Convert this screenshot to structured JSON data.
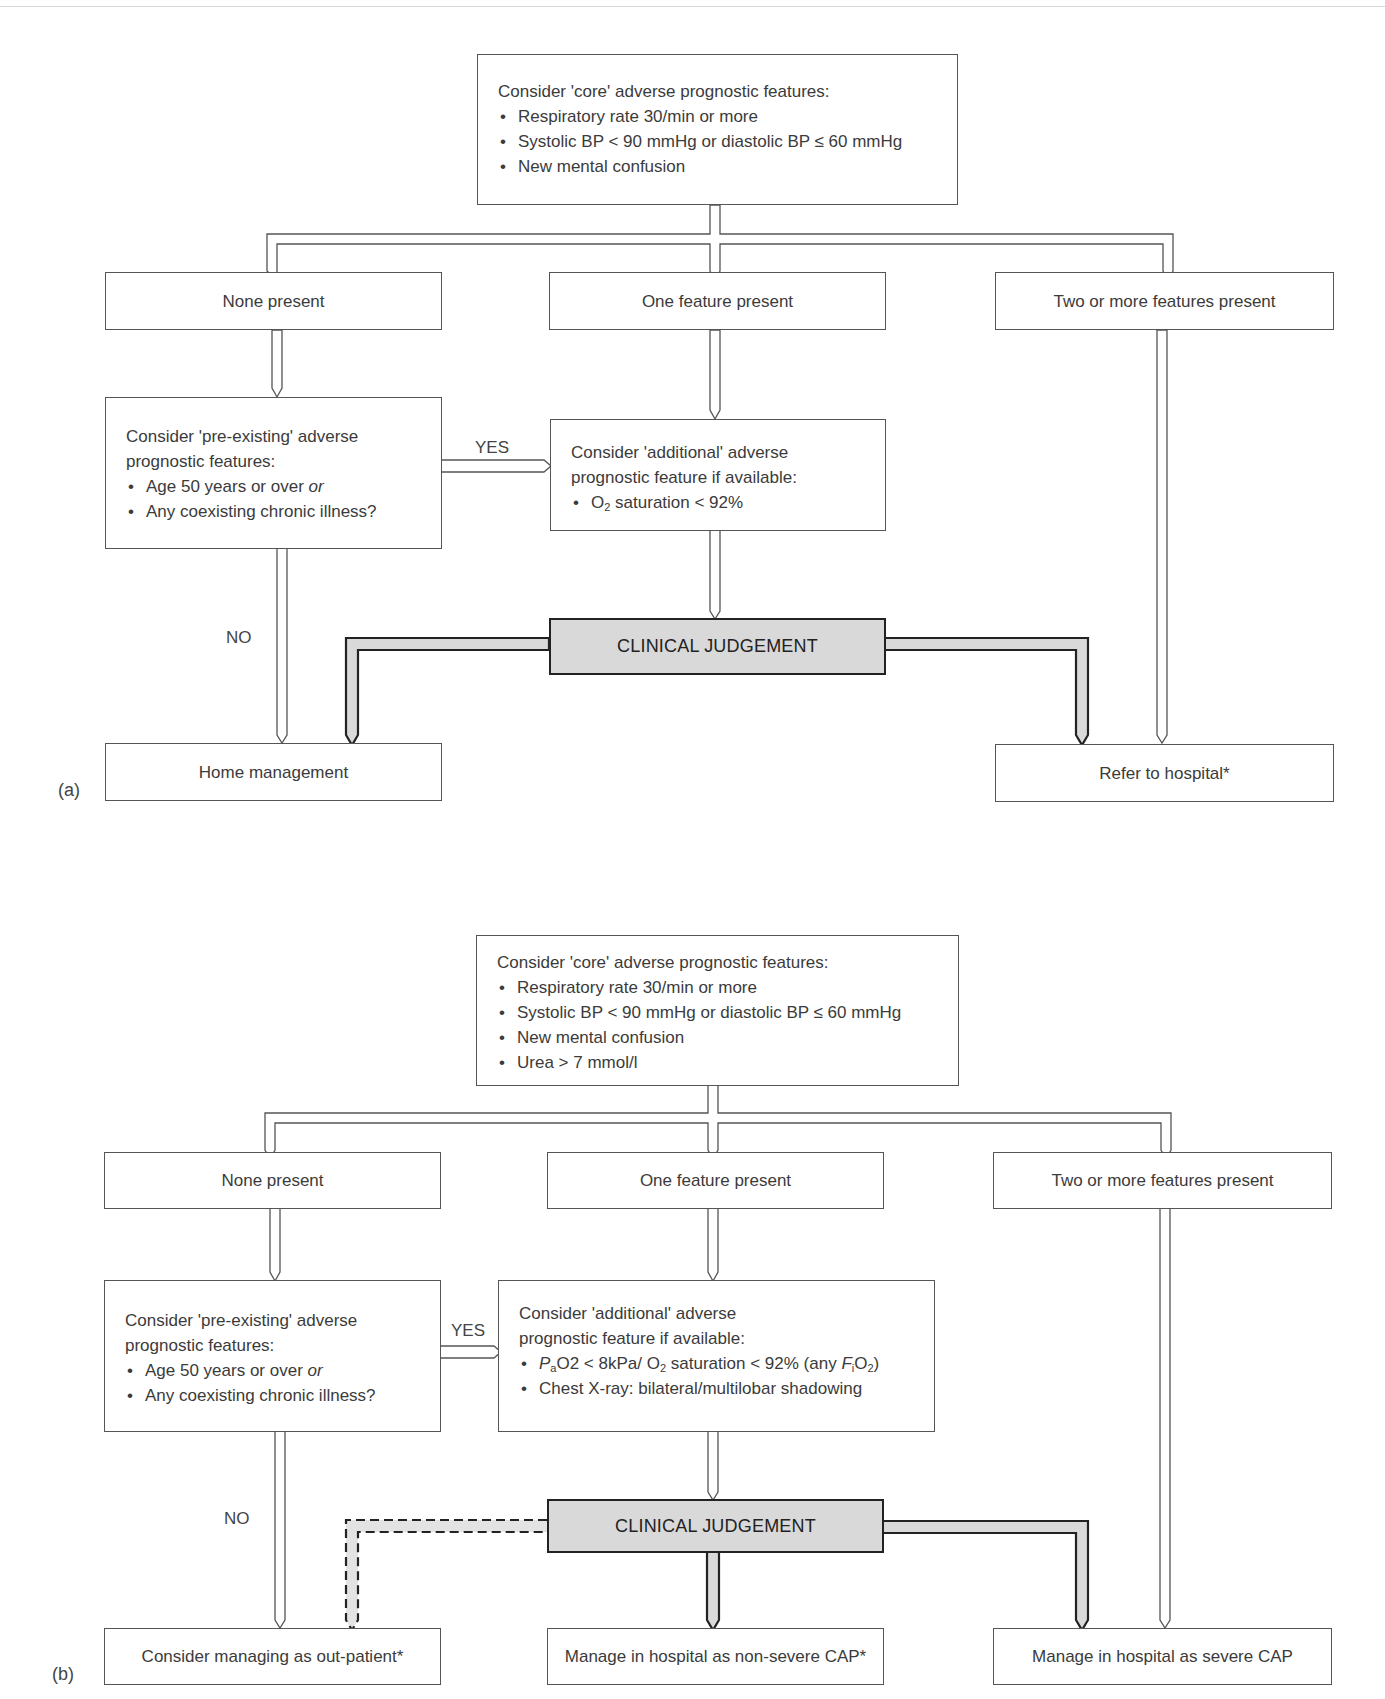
{
  "panel_a": {
    "label": "(a)",
    "core": {
      "title": "Consider 'core' adverse prognostic features:",
      "items": [
        "Respiratory rate 30/min or more",
        "Systolic BP < 90 mmHg or diastolic BP ≤ 60 mmHg",
        "New mental confusion"
      ]
    },
    "branches": {
      "none": "None present",
      "one": "One feature present",
      "two": "Two or more features present"
    },
    "preexisting": {
      "title_line1": "Consider 'pre-existing' adverse",
      "title_line2": "prognostic features:",
      "item1_text": "Age 50 years or over ",
      "item1_or": "or",
      "item2": "Any coexisting chronic illness?"
    },
    "additional": {
      "title_line1": "Consider 'additional' adverse",
      "title_line2": "prognostic feature if available:",
      "item1_o": "O",
      "item1_sub": "2",
      "item1_rest": " saturation < 92%"
    },
    "yes_label": "YES",
    "no_label": "NO",
    "clinical_judgement": "CLINICAL JUDGEMENT",
    "outcomes": {
      "home": "Home management",
      "hospital": "Refer to hospital*"
    }
  },
  "panel_b": {
    "label": "(b)",
    "core": {
      "title": "Consider 'core' adverse prognostic features:",
      "items": [
        "Respiratory rate 30/min or more",
        "Systolic BP < 90 mmHg or diastolic BP ≤ 60 mmHg",
        "New mental confusion",
        "Urea > 7 mmol/l"
      ]
    },
    "branches": {
      "none": "None present",
      "one": "One feature present",
      "two": "Two or more features present"
    },
    "preexisting": {
      "title_line1": "Consider 'pre-existing' adverse",
      "title_line2": "prognostic features:",
      "item1_text": "Age 50 years or over ",
      "item1_or": "or",
      "item2": "Any coexisting chronic illness?"
    },
    "additional": {
      "title_line1": "Consider 'additional' adverse",
      "title_line2": "prognostic feature if available:",
      "item1_p": "P",
      "item1_psub": "a",
      "item1_mid": "O2 < 8kPa/ O",
      "item1_osub": "2",
      "item1_rest": " saturation < 92% (any ",
      "item1_f": "F",
      "item1_fsub": "i",
      "item1_o2": "O",
      "item1_o2sub": "2",
      "item1_close": ")",
      "item2": "Chest X-ray: bilateral/multilobar shadowing"
    },
    "yes_label": "YES",
    "no_label": "NO",
    "clinical_judgement": "CLINICAL JUDGEMENT",
    "outcomes": {
      "outpatient": "Consider managing as out-patient*",
      "nonsevere": "Manage in hospital as non-severe CAP*",
      "severe": "Manage in hospital as severe CAP"
    }
  },
  "colors": {
    "box_border": "#555555",
    "judgement_fill": "#d9d9d9",
    "judgement_border": "#222222",
    "text": "#3b3b3b"
  }
}
